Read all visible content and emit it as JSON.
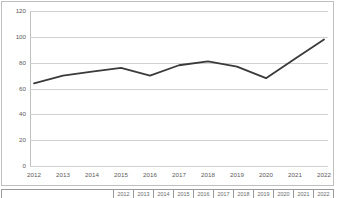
{
  "chart_data": {
    "type": "line",
    "title": "",
    "subtitle": "",
    "xlabel": "",
    "ylabel": "",
    "categories": [
      "2012",
      "2013",
      "2014",
      "2015",
      "2016",
      "2017",
      "2018",
      "2019",
      "2020",
      "2021",
      "2022"
    ],
    "values": [
      64,
      70,
      73,
      76,
      70,
      78,
      81,
      77,
      68,
      83,
      98
    ],
    "series": [
      {
        "name": "",
        "color": "#3a3a3a",
        "values": [
          64,
          70,
          73,
          76,
          70,
          78,
          81,
          77,
          68,
          83,
          98
        ]
      }
    ],
    "ylim": [
      0,
      120
    ],
    "ytick_values": [
      0,
      20,
      40,
      60,
      80,
      100,
      120
    ],
    "ytick_labels": [
      "0",
      "20",
      "40",
      "60",
      "80",
      "100",
      "120"
    ],
    "xtick_labels": [
      "2012",
      "2013",
      "2014",
      "2015",
      "2016",
      "2017",
      "2018",
      "2019",
      "2020",
      "2021",
      "2022"
    ],
    "grid": "horizontal",
    "legend": "none",
    "line_width": 1.8,
    "markers": false
  },
  "chart": {
    "border_color": "#bfbfbf",
    "gridline_color": "#d0d0d0",
    "line_color": "#3a3a3a",
    "tick_label_color": "#5a5a5a",
    "background": "#ffffff"
  },
  "table_strip": {
    "row_label": "",
    "columns": [
      "2012",
      "2013",
      "2014",
      "2015",
      "2016",
      "2017",
      "2018",
      "2019",
      "2020",
      "2021",
      "2022"
    ],
    "border_color": "#9a9a9a"
  }
}
